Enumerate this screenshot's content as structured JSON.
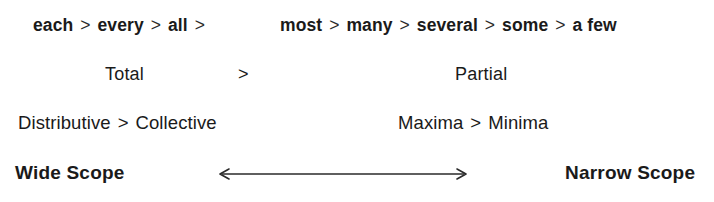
{
  "figure": {
    "background_color": "#ffffff",
    "text_color": "#1a1a1a",
    "rows": [
      {
        "name": "quantifier-scale",
        "strong_group": [
          "each",
          "every",
          "all"
        ],
        "weak_group": [
          "most",
          "many",
          "several",
          "some",
          "a few"
        ]
      },
      {
        "name": "totality",
        "left_label": "Total",
        "operator": ">",
        "right_label": "Partial"
      },
      {
        "name": "readings",
        "left_pair": [
          "Distributive",
          "Collective"
        ],
        "right_pair": [
          "Maxima",
          "Minima"
        ]
      },
      {
        "name": "scope",
        "left_label": "Wide Scope",
        "right_label": "Narrow Scope",
        "axis_icon": "double-headed-horizontal-arrow"
      }
    ]
  },
  "quantifiers": {
    "strong": {
      "item_0": "each",
      "item_1": "every",
      "item_2": "all",
      "op_0": ">",
      "op_1": ">",
      "op_2": ">"
    },
    "weak": {
      "item_0": "most",
      "item_1": "many",
      "item_2": "several",
      "item_3": "some",
      "item_4": "a few",
      "op_0": ">",
      "op_1": ">",
      "op_2": ">",
      "op_3": ">"
    }
  },
  "totality": {
    "total": "Total",
    "operator": ">",
    "partial": "Partial"
  },
  "readings": {
    "distributive": "Distributive",
    "op_left": ">",
    "collective": "Collective",
    "maxima": "Maxima",
    "op_right": ">",
    "minima": "Minima"
  },
  "scope": {
    "wide": "Wide Scope",
    "narrow": "Narrow Scope"
  }
}
